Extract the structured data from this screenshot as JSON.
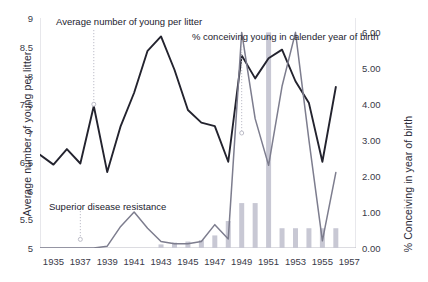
{
  "chart_data": {
    "type": "line",
    "title": "",
    "xlabel": "",
    "x": [
      1934,
      1935,
      1936,
      1937,
      1938,
      1939,
      1940,
      1941,
      1942,
      1943,
      1944,
      1945,
      1946,
      1947,
      1948,
      1949,
      1950,
      1951,
      1952,
      1953,
      1954,
      1955,
      1956
    ],
    "xtick_labels": [
      "1935",
      "1937",
      "1939",
      "1941",
      "1943",
      "1945",
      "1947",
      "1949",
      "1951",
      "1953",
      "1955",
      "1957"
    ],
    "xtick_values": [
      1935,
      1937,
      1939,
      1941,
      1943,
      1945,
      1947,
      1949,
      1951,
      1953,
      1955,
      1957
    ],
    "xlim": [
      1934,
      1957.5
    ],
    "grid": false,
    "legend": "none",
    "axes": [
      {
        "side": "left",
        "ylabel": "Average number of young per litter",
        "ylim": [
          5,
          9
        ],
        "ytick_labels": [
          "5",
          "5.5",
          "6",
          "6.5",
          "7",
          "7.5",
          "8",
          "8.5",
          "9"
        ],
        "ytick_values": [
          5,
          5.5,
          6,
          6.5,
          7,
          7.5,
          8,
          8.5,
          9
        ]
      },
      {
        "side": "right",
        "ylabel": "% Conceiving in year of birth",
        "ylim": [
          0,
          6.4
        ],
        "ytick_labels": [
          "0.00",
          "1.00",
          "2.00",
          "3.00",
          "4.00",
          "5.00",
          "6.00"
        ],
        "ytick_values": [
          0,
          1,
          2,
          3,
          4,
          5,
          6
        ]
      }
    ],
    "series": [
      {
        "name": "Average number of young per litter",
        "type": "line",
        "axis": "left",
        "color": "#23232e",
        "values": [
          6.62,
          6.45,
          6.72,
          6.47,
          7.47,
          6.32,
          7.12,
          7.7,
          8.43,
          8.68,
          8.1,
          7.4,
          7.18,
          7.12,
          6.5,
          8.35,
          7.95,
          8.3,
          8.45,
          7.9,
          7.52,
          6.5,
          7.8
        ]
      },
      {
        "name": "% conceiving young in calender year of birth",
        "type": "line",
        "axis": "right",
        "color": "#7d7d8e",
        "values": [
          0.0,
          0.0,
          0.0,
          0.0,
          0.0,
          0.05,
          0.6,
          1.0,
          0.55,
          0.18,
          0.12,
          0.12,
          0.18,
          0.65,
          0.25,
          6.0,
          3.6,
          2.3,
          4.5,
          6.0,
          3.0,
          0.2,
          2.1
        ]
      },
      {
        "name": "% conceiving (bars)",
        "type": "bar",
        "axis": "right",
        "color": "#c8c8d4",
        "values": [
          0.0,
          0.0,
          0.0,
          0.0,
          0.0,
          0.0,
          0.0,
          0.0,
          0.0,
          0.1,
          0.15,
          0.18,
          0.22,
          0.35,
          0.75,
          1.25,
          1.25,
          6.0,
          0.55,
          0.55,
          0.55,
          0.55,
          0.55
        ]
      }
    ],
    "annotations": [
      {
        "id": "avg",
        "text": "Average number of young per litter",
        "leader_to_x": 1938,
        "leader_to_y_left": 7.5
      },
      {
        "id": "pct",
        "text": "% conceiving young in calender year of birth",
        "leader_to_x": 1949,
        "leader_to_y_left": 7.0
      },
      {
        "id": "sdr",
        "text": "Superior disease resistance",
        "leader_to_x": 1937,
        "leader_to_y_left": 5.15
      }
    ]
  }
}
